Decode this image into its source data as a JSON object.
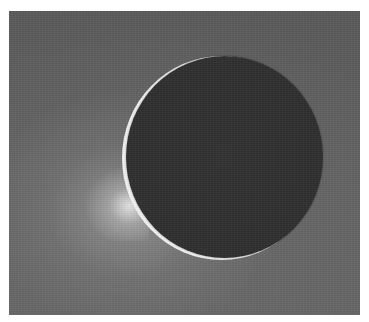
{
  "image": {
    "subject": "backlit moon crescent with plume",
    "colors": {
      "background": "#5f5f5f",
      "disk": "#313131",
      "rim": "#f2f2f2",
      "page": "#ffffff"
    }
  }
}
